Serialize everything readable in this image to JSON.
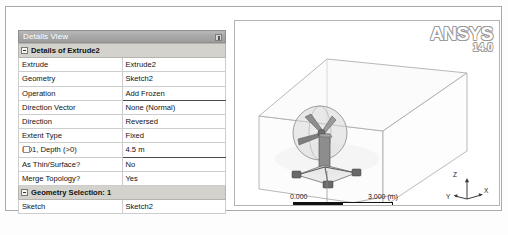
{
  "app": {
    "vendor_logo": "ANSYS",
    "version": "14.0"
  },
  "details_panel": {
    "title": "Details View",
    "pin_icon": "pin-icon",
    "group_header": "Details of Extrude2",
    "rows": [
      {
        "label": "Extrude",
        "value": "Extrude2"
      },
      {
        "label": "Geometry",
        "value": "Sketch2"
      },
      {
        "label": "Operation",
        "value": "Add Frozen"
      },
      {
        "label": "Direction Vector",
        "value": "None (Normal)"
      },
      {
        "label": "Direction",
        "value": "Reversed"
      },
      {
        "label": "Extent Type",
        "value": "Fixed"
      },
      {
        "label": "FD1,  Depth (>0)",
        "value": "4.5 m"
      },
      {
        "label": "As Thin/Surface?",
        "value": "No"
      },
      {
        "label": "Merge Topology?",
        "value": "Yes"
      }
    ],
    "selection_header": "Geometry Selection: 1",
    "selection_rows": [
      {
        "label": "Sketch",
        "value": "Sketch2"
      }
    ]
  },
  "viewport": {
    "scale": {
      "min": "0.000",
      "max": "3.000 (m)",
      "mid": "1.500"
    },
    "triad": {
      "x": "X",
      "y": "Y",
      "z": "Z"
    },
    "model_name": "wind-turbine-in-enclosure"
  },
  "colors": {
    "titlebar": "#a9a9a9",
    "group_row": "#d4d2cd",
    "grid_line": "#cdcdcd",
    "frame_border": "#a9a9a9",
    "text": "#121212",
    "wire": "#9a9a9a"
  }
}
